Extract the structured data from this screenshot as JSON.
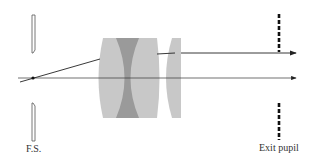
{
  "diagram": {
    "type": "optical ray diagram",
    "labels": {
      "field_stop": "F.S.",
      "exit_pupil": "Exit pupil"
    },
    "elements": [
      {
        "name": "field-stop",
        "kind": "aperture"
      },
      {
        "name": "doublet-lens",
        "kind": "cemented doublet (convex-concave-convex)"
      },
      {
        "name": "singlet-lens",
        "kind": "positive lens"
      },
      {
        "name": "exit-pupil",
        "kind": "dashed stop"
      }
    ],
    "rays": [
      {
        "name": "axial-ray",
        "direction": "right"
      },
      {
        "name": "oblique-ray",
        "direction": "right"
      }
    ],
    "colors": {
      "lens_light": "#c8c8c8",
      "lens_dark": "#9a9a9a",
      "line": "#222222"
    }
  }
}
